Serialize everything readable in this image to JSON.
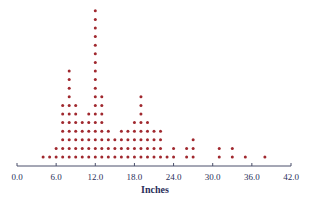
{
  "chart_data": {
    "type": "scatter",
    "subtype": "dot-plot",
    "title": "",
    "xlabel": "Inches",
    "ylabel": "",
    "xlim": [
      0,
      42
    ],
    "xticks": [
      0,
      6,
      12,
      18,
      24,
      30,
      36,
      42
    ],
    "xtick_labels": [
      "0.0",
      "6.0",
      "12.0",
      "18.0",
      "24.0",
      "30.0",
      "36.0",
      "42.0"
    ],
    "grid": false,
    "legend": null,
    "dot_color": "#a0282e",
    "axis_color": "#4a4f6a",
    "x": [
      4,
      5,
      6,
      7,
      8,
      9,
      10,
      11,
      12,
      13,
      14,
      15,
      16,
      17,
      18,
      19,
      20,
      21,
      22,
      23,
      24,
      26,
      27,
      31,
      33,
      35,
      38
    ],
    "counts": [
      1,
      1,
      2,
      7,
      11,
      7,
      5,
      6,
      18,
      8,
      4,
      3,
      4,
      4,
      5,
      8,
      5,
      4,
      4,
      1,
      2,
      2,
      3,
      2,
      2,
      1,
      1
    ]
  },
  "axis": {
    "title": "Inches",
    "tick_labels": [
      "0.0",
      "6.0",
      "12.0",
      "18.0",
      "24.0",
      "30.0",
      "36.0",
      "42.0"
    ]
  }
}
